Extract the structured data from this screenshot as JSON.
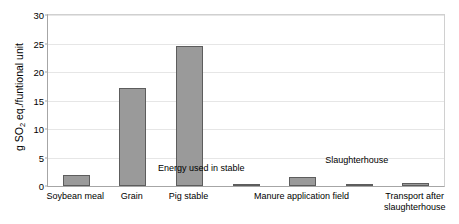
{
  "chart_data": {
    "type": "bar",
    "title": "",
    "xlabel": "",
    "ylabel": "g SO2 eq./funtional unit",
    "ylabel_parts": {
      "prefix": "g SO",
      "sub": "2",
      "suffix": " eq./funtional unit"
    },
    "ylim": [
      0,
      30
    ],
    "ytick_step": 5,
    "yticks": [
      "0",
      "5",
      "10",
      "15",
      "20",
      "25",
      "30"
    ],
    "grid": true,
    "legend": "none",
    "bar_color": "#9a9a9a",
    "bar_edge_color": "#5d5d5d",
    "categories": [
      "Soybean meal",
      "Grain",
      "Pig stable",
      "Energy used in stable",
      "Manure application field",
      "Slaughterhouse",
      "Transport after\nslaughterhouse"
    ],
    "values": [
      2.0,
      17.2,
      24.6,
      0.15,
      1.6,
      0.4,
      0.45
    ],
    "axis_category_labels": [
      "Soybean meal",
      "Grain",
      "Pig stable",
      "Manure application field",
      "Transport after\nslaughterhouse"
    ],
    "in_plot_annotations": [
      "Energy used in stable",
      "Slaughterhouse"
    ]
  }
}
